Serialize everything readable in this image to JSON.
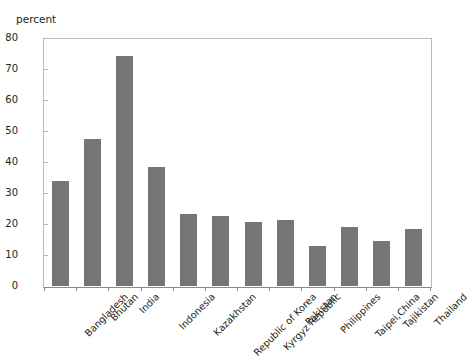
{
  "chart_title": "",
  "axis_unit_label": "percent",
  "colors": {
    "bar": "#767676",
    "frame": "#b9b9b9",
    "baseline": "#8a8a8a",
    "text": "#231f20",
    "background": "#ffffff"
  },
  "chart_data": {
    "type": "bar",
    "title": "",
    "xlabel": "",
    "ylabel": "percent",
    "ylim": [
      0,
      80
    ],
    "yticks": [
      0,
      10,
      20,
      30,
      40,
      50,
      60,
      70,
      80
    ],
    "grid": false,
    "legend": "none",
    "categories": [
      "Bangladesh",
      "Bhutan",
      "India",
      "Indonesia",
      "Kazakhstan",
      "Republic of Korea",
      "Kyrgyz Republic",
      "Pakistan",
      "Philippines",
      "Taipei,China",
      "Tajikistan",
      "Thailand"
    ],
    "values": [
      33.9,
      47.4,
      74.2,
      38.4,
      23.2,
      22.6,
      20.6,
      21.3,
      12.9,
      19.0,
      14.5,
      18.4
    ]
  }
}
